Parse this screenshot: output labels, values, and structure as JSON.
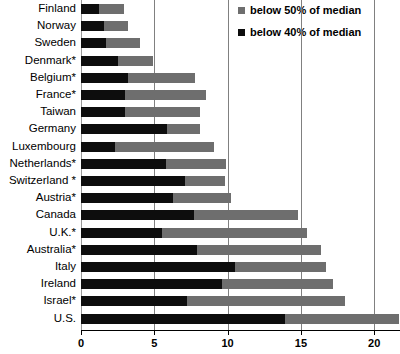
{
  "chart_data": {
    "type": "bar",
    "orientation": "horizontal",
    "stacked": true,
    "title": "",
    "subtitle": "",
    "xlabel": "",
    "ylabel": "",
    "xlim": [
      0,
      21.8
    ],
    "xticks": [
      0,
      5,
      10,
      15,
      20
    ],
    "xtick_labels": [
      "0",
      "5",
      "10",
      "15",
      "20"
    ],
    "grid": "vertical",
    "legend_position": "top-right",
    "categories": [
      "Finland",
      "Norway",
      "Sweden",
      "Denmark*",
      "Belgium*",
      "France*",
      "Taiwan",
      "Germany",
      "Luxembourg",
      "Netherlands*",
      "Switzerland *",
      "Austria*",
      "Canada",
      "U.K.*",
      "Australia*",
      "Italy",
      "Ireland",
      "Israel*",
      "U.S."
    ],
    "series": [
      {
        "name": "below 40% of median",
        "color": "#0d0d0d",
        "values": [
          1.2,
          1.6,
          1.7,
          2.5,
          3.2,
          3.0,
          3.0,
          5.9,
          2.3,
          5.8,
          7.1,
          6.3,
          7.7,
          5.5,
          7.9,
          10.5,
          9.6,
          7.2,
          13.9
        ]
      },
      {
        "name": "below 50% of median",
        "color": "#6e6e6e",
        "values": [
          2.9,
          3.2,
          4.0,
          4.9,
          7.8,
          8.5,
          8.1,
          8.1,
          9.1,
          9.9,
          9.8,
          10.2,
          14.8,
          15.4,
          16.4,
          16.7,
          17.2,
          18.0,
          21.7
        ]
      }
    ],
    "legend": [
      {
        "label": "below 50% of median",
        "color": "#6e6e6e"
      },
      {
        "label": "below 40% of median",
        "color": "#0d0d0d"
      }
    ]
  }
}
